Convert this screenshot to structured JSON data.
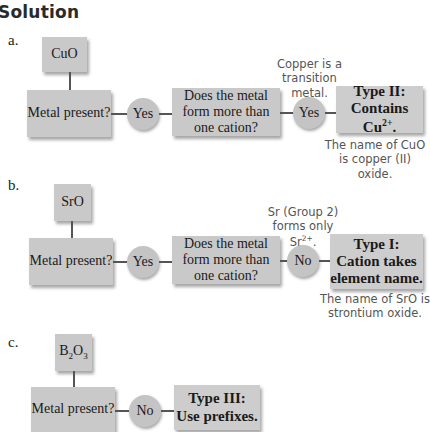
{
  "heading": "Solution",
  "flowcharts": [
    {
      "label": "a.",
      "formula": "CuO",
      "q1": "Metal present?",
      "a1": "Yes",
      "q2": "Does the metal form more than one cation?",
      "a2": "Yes",
      "note_top": "Copper is a transition metal.",
      "result_line1": "Type II:",
      "result_line2": "Contains Cu",
      "result_sup": "2+",
      "result_tail": ".",
      "note_bottom": "The name of CuO is copper (II) oxide."
    },
    {
      "label": "b.",
      "formula": "SrO",
      "q1": "Metal present?",
      "a1": "Yes",
      "q2": "Does the metal form more than one cation?",
      "a2": "No",
      "note_top_line1": "Sr (Group 2)",
      "note_top_line2": "forms only",
      "note_top_sym": "Sr",
      "note_top_sup": "2+",
      "note_top_tail": ".",
      "result_line1": "Type I:",
      "result_line2": "Cation takes",
      "result_line3": "element name.",
      "note_bottom": "The name of SrO is strontium oxide."
    },
    {
      "label": "c.",
      "formula_b": "B",
      "formula_sub1": "2",
      "formula_o": "O",
      "formula_sub2": "3",
      "q1": "Metal present?",
      "a1": "No",
      "result_line1": "Type III:",
      "result_line2": "Use prefixes."
    }
  ]
}
